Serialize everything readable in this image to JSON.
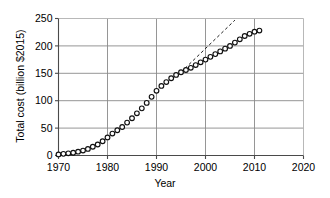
{
  "chart_data": {
    "type": "scatter",
    "title": "",
    "xlabel": "Year",
    "ylabel": "Total cost (billion $2015)",
    "xlim": [
      1970,
      2020
    ],
    "ylim": [
      0,
      250
    ],
    "xticks": [
      1970,
      1980,
      1990,
      2000,
      2010,
      2020
    ],
    "yticks": [
      0,
      50,
      100,
      150,
      200,
      250
    ],
    "grid": true,
    "legend": "none",
    "marker": "open-circle",
    "series": [
      {
        "name": "Total cost",
        "style": "open-circle-markers",
        "x": [
          1970,
          1971,
          1972,
          1973,
          1974,
          1975,
          1976,
          1977,
          1978,
          1979,
          1980,
          1981,
          1982,
          1983,
          1984,
          1985,
          1986,
          1987,
          1988,
          1989,
          1990,
          1991,
          1992,
          1993,
          1994,
          1995,
          1996,
          1997,
          1998,
          1999,
          2000,
          2001,
          2002,
          2003,
          2004,
          2005,
          2006,
          2007,
          2008,
          2009,
          2010,
          2011
        ],
        "values": [
          2,
          3,
          4,
          5,
          7,
          9,
          12,
          16,
          20,
          26,
          33,
          40,
          46,
          52,
          60,
          68,
          77,
          86,
          96,
          107,
          118,
          127,
          134,
          141,
          147,
          152,
          156,
          160,
          165,
          170,
          175,
          180,
          185,
          190,
          195,
          200,
          206,
          212,
          218,
          222,
          226,
          228
        ]
      },
      {
        "name": "Linear extrapolation",
        "style": "dashed-line",
        "x": [
          1995,
          2006
        ],
        "values": [
          152,
          247
        ]
      }
    ],
    "annotations": []
  }
}
